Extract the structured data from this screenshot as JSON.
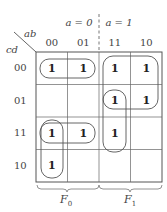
{
  "headers": {
    "a0": "a = 0",
    "a1": "a = 1",
    "ab": "ab",
    "cd": "cd",
    "cols": [
      "00",
      "01",
      "11",
      "10"
    ],
    "rows": [
      "00",
      "01",
      "11",
      "10"
    ]
  },
  "cells": [
    [
      "1",
      "1",
      "1",
      "1"
    ],
    [
      "",
      "",
      "1",
      "1"
    ],
    [
      "1",
      "1",
      "1",
      ""
    ],
    [
      "1",
      "",
      "",
      ""
    ]
  ],
  "footer": {
    "f0": "F",
    "f0_sub": "0",
    "f1": "F",
    "f1_sub": "1"
  },
  "colors": {
    "line": "#555555",
    "text": "#333333"
  }
}
